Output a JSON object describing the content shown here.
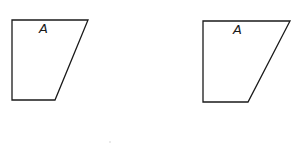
{
  "figures": [
    {
      "name": "trapezoid-left",
      "label": "A",
      "points": [
        [
          12,
          20
        ],
        [
          88,
          20
        ],
        [
          55,
          100
        ],
        [
          12,
          100
        ]
      ],
      "label_pos": [
        39,
        33
      ]
    },
    {
      "name": "trapezoid-right",
      "label": "A",
      "points": [
        [
          203,
          21
        ],
        [
          290,
          21
        ],
        [
          248,
          102
        ],
        [
          203,
          102
        ]
      ],
      "label_pos": [
        233,
        34
      ]
    }
  ],
  "colors": {
    "stroke": "#1a1a1a",
    "background": "#ffffff"
  }
}
